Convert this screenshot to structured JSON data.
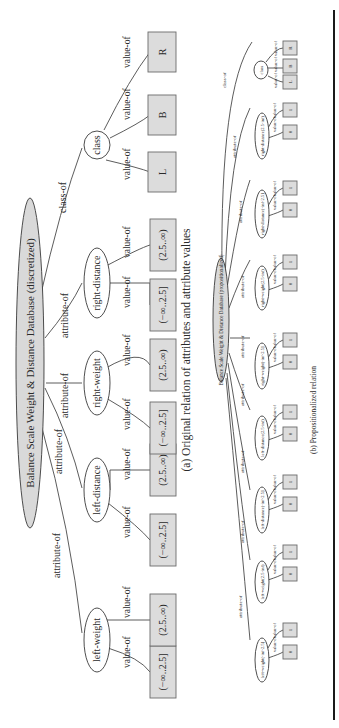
{
  "figure_a": {
    "root": "Balance Scale Weight & Distance Database (discretized)",
    "caption": "(a) Original relation of attributes and attribute values",
    "edge_attr": "attribute-of",
    "edge_class": "class-of",
    "edge_value": "value-of",
    "nodes": [
      {
        "label": "left-weight",
        "values": [
          "(−∞..2.5]",
          "(2.5..∞)"
        ]
      },
      {
        "label": "left-distance",
        "values": [
          "(−∞..2.5]",
          "(2.5..∞)"
        ]
      },
      {
        "label": "right-weight",
        "values": [
          "(−∞..2.5]",
          "(2.5..∞)"
        ]
      },
      {
        "label": "right-distance",
        "values": [
          "(−∞..2.5]",
          "(2.5..∞)"
        ]
      },
      {
        "label": "class",
        "values": [
          "L",
          "B",
          "R"
        ]
      }
    ]
  },
  "figure_b": {
    "root": "Balance Scale Weight & Distance Database (propositionalized)",
    "caption": "(b) Propositionalized relation",
    "edge_attr": "attribute-of",
    "edge_class": "class-of",
    "edge_value": "value-of",
    "nodes": [
      {
        "label": "left-weight(-inf-2.5]",
        "values": [
          "0",
          "1"
        ]
      },
      {
        "label": "left-weight(2.5-inf)",
        "values": [
          "0",
          "1"
        ]
      },
      {
        "label": "left-distance(-inf-2.5]",
        "values": [
          "0",
          "1"
        ]
      },
      {
        "label": "left-distance(2.5-inf)",
        "values": [
          "0",
          "1"
        ]
      },
      {
        "label": "right-weight(-inf-2.5]",
        "values": [
          "0",
          "1"
        ]
      },
      {
        "label": "right-weight(2.5-inf)",
        "values": [
          "0",
          "1"
        ]
      },
      {
        "label": "right-distance(-inf-2.5]",
        "values": [
          "0",
          "1"
        ]
      },
      {
        "label": "right-distance(2.5-inf)",
        "values": [
          "0",
          "1"
        ]
      },
      {
        "label": "class",
        "values": [
          "L",
          "B",
          "R"
        ]
      }
    ]
  }
}
